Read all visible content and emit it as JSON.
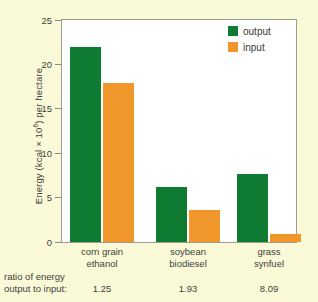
{
  "chart_data": {
    "type": "bar",
    "title": "",
    "xlabel": "",
    "ylabel": "Energy (kcal × 10⁶) per hectare",
    "ylabel_parts": {
      "pre": "Energy (kcal × 10",
      "sup": "6",
      "post": ") per hectare"
    },
    "ylim": [
      0,
      25
    ],
    "yticks": [
      0,
      5,
      10,
      15,
      20,
      25
    ],
    "ytick_labels": [
      "0",
      "5",
      "10",
      "15",
      "20",
      "25"
    ],
    "grid": false,
    "legend_position": "top-right",
    "categories": [
      "corn grain ethanol",
      "soybean biodiesel",
      "grass synfuel"
    ],
    "category_lines": [
      [
        "corn grain",
        "ethanol"
      ],
      [
        "soybean",
        "biodiesel"
      ],
      [
        "grass",
        "synfuel"
      ]
    ],
    "series": [
      {
        "name": "output",
        "color": "#0f7a31",
        "values": [
          22.0,
          6.2,
          7.7
        ]
      },
      {
        "name": "input",
        "color": "#f0962a",
        "values": [
          17.9,
          3.6,
          0.95
        ]
      }
    ],
    "annotation_row": {
      "label_lines": [
        "ratio of energy",
        "output to input:"
      ],
      "values": [
        "1.25",
        "1.93",
        "8.09"
      ]
    }
  },
  "legend": {
    "items": [
      {
        "label": "output",
        "color": "#0f7a31",
        "swatch": "legend-swatch-output"
      },
      {
        "label": "input",
        "color": "#f0962a",
        "swatch": "legend-swatch-input"
      }
    ]
  },
  "colors": {
    "background": "#fbfad8",
    "plot_background": "#ffffff",
    "axis": "#9c9c92",
    "text": "#40403a",
    "output": "#0f7a31",
    "input": "#f0962a"
  }
}
